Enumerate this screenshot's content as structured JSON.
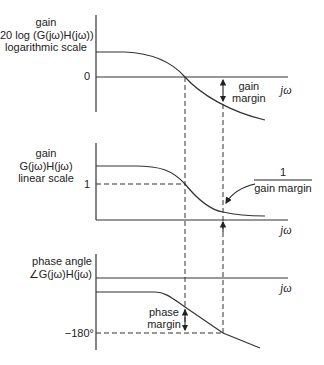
{
  "diagram": {
    "colors": {
      "line": "#333333",
      "text": "#222222",
      "background": "#ffffff"
    }
  },
  "panels": [
    {
      "id": "log-gain",
      "ylabel_lines": [
        "gain",
        "20 log (G(jω)H(jω))",
        "logarithmic scale"
      ],
      "ref_tick": "0",
      "x_label": "jω",
      "annotation_lines": [
        "gain",
        "margin"
      ]
    },
    {
      "id": "linear-gain",
      "ylabel_lines": [
        "gain",
        "G(jω)H(jω)",
        "linear scale"
      ],
      "ref_tick": "1",
      "x_label": "jω",
      "annotation_numerator": "1",
      "annotation_denominator": "gain margin"
    },
    {
      "id": "phase",
      "ylabel_lines": [
        "phase angle",
        "∠G(jω)H(jω)"
      ],
      "ref_tick": "−180°",
      "x_label": "jω",
      "annotation_lines": [
        "phase",
        "margin"
      ]
    }
  ]
}
